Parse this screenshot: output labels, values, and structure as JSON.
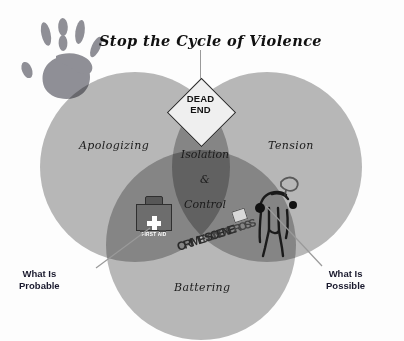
{
  "diagram": {
    "title": "Stop the Cycle of Violence",
    "sign": {
      "line1": "DEAD",
      "line2": "END"
    },
    "circles": [
      {
        "name": "apologizing",
        "label": "Apologizing",
        "color": "#b9b9b9"
      },
      {
        "name": "tension",
        "label": "Tension",
        "color": "#b9b9b9"
      },
      {
        "name": "battering",
        "label": "Battering",
        "color": "#b9b9b9"
      }
    ],
    "center": {
      "line1": "Isolation",
      "line2": "&",
      "line3": "Control"
    },
    "callouts": [
      {
        "name": "probable",
        "line1": "What Is",
        "line2": "Probable"
      },
      {
        "name": "possible",
        "line1": "What Is",
        "line2": "Possible"
      }
    ],
    "icons": {
      "handprint": "handprint-icon",
      "first_aid": {
        "name": "first-aid-kit-icon",
        "label": "FIRST AID",
        "cross": "plus-symbol"
      },
      "crime_tape": {
        "name": "crime-scene-tape-icon",
        "text": "CRIME SCENE",
        "text_overlay": "DO NOT CROSS"
      },
      "body_outline": "chalk-body-outline-icon"
    },
    "colors": {
      "circle_fill": "#b9b9b9",
      "overlap_center": "#8d8d8d",
      "handprint": "#8f8f96",
      "leader_line": "#9a9a9a",
      "text": "#1b1b1b",
      "callout_text": "#1a1a2e",
      "background": "#fdfdfd"
    }
  }
}
